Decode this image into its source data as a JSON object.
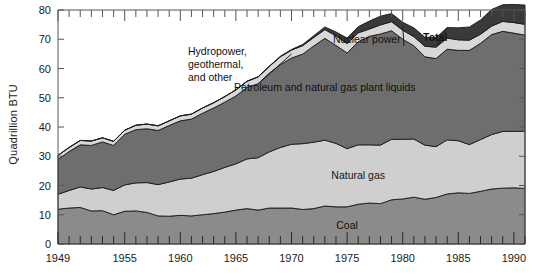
{
  "figure": {
    "ylabel": "Quadrillion BTU",
    "background": "#ffffff"
  },
  "chart_data": {
    "type": "area",
    "title": "",
    "xlabel": "",
    "ylabel": "Quadrillion BTU",
    "xlim": [
      1949,
      1991
    ],
    "ylim": [
      0,
      80
    ],
    "ytick_labels": [
      "0",
      "10",
      "20",
      "30",
      "40",
      "50",
      "60",
      "70",
      "80"
    ],
    "yticks": [
      0,
      10,
      20,
      30,
      40,
      50,
      60,
      70,
      80
    ],
    "xtick_labels": [
      "1949",
      "1955",
      "1960",
      "1965",
      "1970",
      "1975",
      "1980",
      "1985",
      "1990"
    ],
    "xticks": [
      1949,
      1955,
      1960,
      1965,
      1970,
      1975,
      1980,
      1985,
      1990
    ],
    "minor_xtick_interval": 1,
    "grid": false,
    "legend_position": "inline-band-labels",
    "stacked": true,
    "x": [
      1949,
      1950,
      1951,
      1952,
      1953,
      1954,
      1955,
      1956,
      1957,
      1958,
      1959,
      1960,
      1961,
      1962,
      1963,
      1964,
      1965,
      1966,
      1967,
      1968,
      1969,
      1970,
      1971,
      1972,
      1973,
      1974,
      1975,
      1976,
      1977,
      1978,
      1979,
      1980,
      1981,
      1982,
      1983,
      1984,
      1985,
      1986,
      1987,
      1988,
      1989,
      1990,
      1991
    ],
    "series": [
      {
        "name": "Coal",
        "color": "#8b8b8b",
        "label_position": "inside",
        "values": [
          11.9,
          12.3,
          12.5,
          11.3,
          11.4,
          10.0,
          11.2,
          11.3,
          10.8,
          9.6,
          9.5,
          9.8,
          9.6,
          10.0,
          10.4,
          10.9,
          11.6,
          12.1,
          11.6,
          12.3,
          12.3,
          12.3,
          11.8,
          12.1,
          13.0,
          12.7,
          12.7,
          13.6,
          14.0,
          13.8,
          15.1,
          15.4,
          16.0,
          15.3,
          15.9,
          17.1,
          17.5,
          17.3,
          18.0,
          18.8,
          19.1,
          19.2,
          19.0
        ]
      },
      {
        "name": "Natural gas",
        "color": "#cfcfcf",
        "label_position": "inside",
        "values": [
          5.1,
          6.0,
          7.0,
          7.5,
          7.9,
          8.3,
          9.0,
          9.6,
          10.2,
          10.7,
          11.7,
          12.4,
          12.9,
          13.7,
          14.4,
          15.3,
          15.8,
          17.0,
          17.9,
          19.2,
          20.7,
          21.8,
          22.5,
          22.7,
          22.5,
          21.7,
          19.9,
          20.3,
          19.9,
          20.0,
          20.7,
          20.4,
          19.9,
          18.5,
          17.4,
          18.5,
          17.8,
          16.7,
          17.7,
          18.6,
          19.4,
          19.3,
          19.6
        ]
      },
      {
        "name": "Petroleum and natural gas plant liquids",
        "color": "#6e6e6e",
        "label_position": "inside",
        "values": [
          11.9,
          13.3,
          14.4,
          14.9,
          15.6,
          15.4,
          17.3,
          18.2,
          18.4,
          18.5,
          19.3,
          19.9,
          20.2,
          21.0,
          21.7,
          22.3,
          23.2,
          24.4,
          25.3,
          26.9,
          28.3,
          29.5,
          30.6,
          32.9,
          34.8,
          33.5,
          32.7,
          35.2,
          37.1,
          38.0,
          37.1,
          34.2,
          31.9,
          30.2,
          30.1,
          31.0,
          30.9,
          32.2,
          32.9,
          34.2,
          34.2,
          33.6,
          32.8
        ]
      },
      {
        "name": "Hydropower, geothermal, and other",
        "color": "#d8d8d8",
        "label_position": "callout",
        "values": [
          1.4,
          1.4,
          1.5,
          1.5,
          1.4,
          1.4,
          1.4,
          1.5,
          1.6,
          1.6,
          1.6,
          1.7,
          1.7,
          1.8,
          1.8,
          1.9,
          2.1,
          2.1,
          2.3,
          2.3,
          2.7,
          2.7,
          2.9,
          2.9,
          3.0,
          3.3,
          3.2,
          3.1,
          2.5,
          3.1,
          3.1,
          3.1,
          3.1,
          3.6,
          3.9,
          3.8,
          3.6,
          3.5,
          3.1,
          2.9,
          3.4,
          3.6,
          3.7
        ]
      },
      {
        "name": "Nuclear power",
        "color": "#3a3a3a",
        "label_position": "callout",
        "values": [
          0.0,
          0.0,
          0.0,
          0.0,
          0.0,
          0.0,
          0.0,
          0.0,
          0.0,
          0.0,
          0.0,
          0.0,
          0.0,
          0.0,
          0.0,
          0.0,
          0.0,
          0.1,
          0.1,
          0.1,
          0.2,
          0.2,
          0.4,
          0.6,
          0.9,
          1.3,
          1.9,
          2.1,
          2.7,
          3.0,
          2.8,
          2.7,
          3.0,
          3.1,
          3.2,
          3.6,
          4.1,
          4.5,
          4.9,
          5.7,
          5.7,
          6.2,
          6.6
        ]
      }
    ],
    "annotations": [
      {
        "name": "hydro-callout",
        "text_lines": [
          "Hydropower,",
          "geothermal,",
          "and other"
        ],
        "bold": false
      },
      {
        "name": "nuclear-callout",
        "text_lines": [
          "Nuclear power"
        ],
        "bold": false
      },
      {
        "name": "total-callout",
        "text_lines": [
          "Total"
        ],
        "bold": true
      }
    ]
  }
}
